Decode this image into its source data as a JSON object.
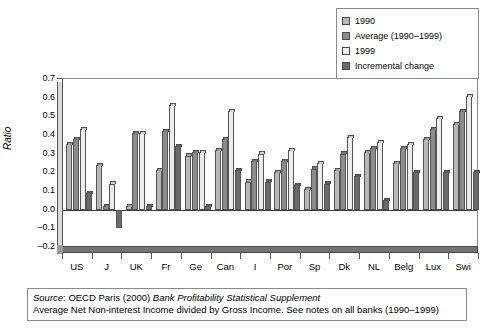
{
  "chart_data": {
    "type": "bar",
    "title": "",
    "xlabel": "",
    "ylabel": "Ratio",
    "ylim": [
      -0.2,
      0.7
    ],
    "ytick_values": [
      0.7,
      0.6,
      0.5,
      0.4,
      0.3,
      0.2,
      0.1,
      0.0,
      -0.1,
      -0.2
    ],
    "ytick_labels": [
      "0.7",
      "0.6",
      "0.5",
      "0.4",
      "0.3",
      "0.2",
      "0.1",
      "0.0",
      "-0.1",
      "-0.2"
    ],
    "grid": false,
    "legend_position": "top-right",
    "categories": [
      "US",
      "J",
      "UK",
      "Fr",
      "Ge",
      "Can",
      "I",
      "Por",
      "Sp",
      "Dk",
      "NL",
      "Belg",
      "Lux",
      "Swi"
    ],
    "series": [
      {
        "name": "1990",
        "color": "#b8b8b8",
        "values": [
          0.35,
          0.24,
          0.02,
          0.21,
          0.29,
          0.32,
          0.15,
          0.2,
          0.11,
          0.21,
          0.31,
          0.25,
          0.38,
          0.46
        ]
      },
      {
        "name": "Average (1990–1999)",
        "color": "#8c8c8c",
        "values": [
          0.38,
          0.02,
          0.41,
          0.42,
          0.31,
          0.38,
          0.26,
          0.26,
          0.22,
          0.3,
          0.33,
          0.33,
          0.43,
          0.53
        ]
      },
      {
        "name": "1999",
        "color": "#ededed",
        "values": [
          0.43,
          0.14,
          0.41,
          0.56,
          0.31,
          0.53,
          0.3,
          0.32,
          0.25,
          0.39,
          0.36,
          0.35,
          0.49,
          0.61
        ]
      },
      {
        "name": "Incremental change",
        "color": "#6b6b6b",
        "values": [
          0.09,
          -0.1,
          0.02,
          0.34,
          0.02,
          0.21,
          0.15,
          0.13,
          0.14,
          0.18,
          0.05,
          0.2,
          0.2,
          0.2
        ]
      }
    ]
  },
  "legend": {
    "items": [
      {
        "label": "1990",
        "color": "#b8b8b8"
      },
      {
        "label": "Average (1990–1999)",
        "color": "#8c8c8c"
      },
      {
        "label": "1999",
        "color": "#ededed"
      },
      {
        "label": "Incremental change",
        "color": "#6b6b6b"
      }
    ]
  },
  "caption": {
    "line1_prefix": "Source",
    "line1_mid": ": OECD Paris (2000) ",
    "line1_italic": "Bank Profitability Statistical Supplement",
    "line2": "Average Net Non-interest Income divided by Gross Income. See notes on all banks (1990–1999)"
  }
}
